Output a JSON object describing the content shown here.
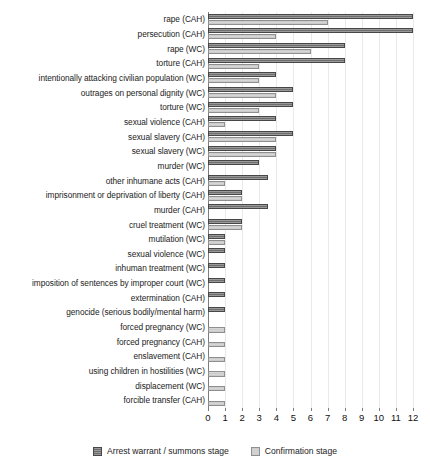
{
  "chart_data": {
    "type": "bar",
    "orientation": "horizontal",
    "title": "",
    "xlabel": "",
    "ylabel": "",
    "xlim": [
      0,
      12
    ],
    "xticks": [
      0,
      1,
      2,
      3,
      4,
      5,
      6,
      7,
      8,
      9,
      10,
      11,
      12
    ],
    "grid": true,
    "grid_axis": "x",
    "legend_position": "bottom-center",
    "categories": [
      "rape (CAH)",
      "persecution (CAH)",
      "rape (WC)",
      "torture (CAH)",
      "intentionally attacking civilian population (WC)",
      "outrages on personal dignity (WC)",
      "torture (WC)",
      "sexual violence (CAH)",
      "sexual slavery (CAH)",
      "sexual slavery (WC)",
      "murder (WC)",
      "other inhumane acts (CAH)",
      "imprisonment or deprivation of liberty (CAH)",
      "murder (CAH)",
      "cruel treatment (WC)",
      "mutilation (WC)",
      "sexual violence (WC)",
      "inhuman treatment (WC)",
      "imposition of sentences by improper court (WC)",
      "extermination (CAH)",
      "genocide (serious bodily/mental harm)",
      "forced pregnancy (WC)",
      "forced pregnancy (CAH)",
      "enslavement (CAH)",
      "using children in hostilities (WC)",
      "displacement (WC)",
      "forcible transfer (CAH)"
    ],
    "series": [
      {
        "name": "Arrest warrant / summons stage",
        "color": "#6e6e6e",
        "values": [
          12,
          12,
          8,
          8,
          4,
          5,
          5,
          4,
          5,
          4,
          3,
          3.5,
          2,
          3.5,
          2,
          1,
          1,
          1,
          1,
          1,
          1,
          0,
          0,
          0,
          0,
          0,
          0
        ]
      },
      {
        "name": "Confirmation stage",
        "color": "#d6d6d6",
        "values": [
          7,
          4,
          6,
          3,
          3,
          4,
          3,
          1,
          4,
          4,
          0,
          1,
          2,
          0,
          2,
          1,
          0,
          0,
          0,
          0,
          0,
          1,
          1,
          1,
          1,
          1,
          1
        ]
      }
    ]
  },
  "legend": {
    "items": [
      {
        "label": "Arrest warrant / summons stage",
        "style": "dark"
      },
      {
        "label": "Confirmation stage",
        "style": "light"
      }
    ]
  }
}
